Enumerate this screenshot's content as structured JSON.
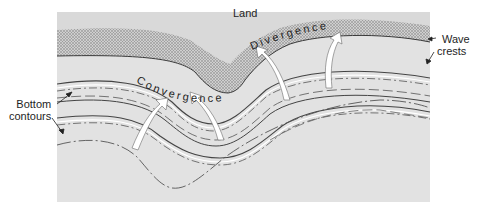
{
  "diagram": {
    "labels": {
      "land": "Land",
      "convergence": "Convergence",
      "divergence": "Divergence",
      "wave_crests_line1": "Wave",
      "wave_crests_line2": "crests",
      "bottom_contours_line1": "Bottom",
      "bottom_contours_line2": "contours"
    },
    "colors": {
      "water_background": "#e2e2e2",
      "land_stipple": "#8a8a8a",
      "shoreline": "#3a3a3a",
      "contour_line": "#4a4a4a",
      "wave_crest_line": "#555555",
      "arrow_fill": "#ffffff",
      "text": "#1e1e1e"
    },
    "elements": {
      "wave_crest_lines": 3,
      "bottom_contour_lines": 3,
      "orthogonal_arrows": 4
    }
  }
}
